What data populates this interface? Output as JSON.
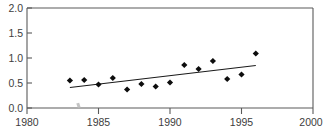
{
  "chart_data": {
    "type": "scatter",
    "title": "",
    "xlabel": "",
    "ylabel": "",
    "xlim": [
      1980,
      2000
    ],
    "ylim": [
      0.0,
      2.0
    ],
    "xticks": [
      1980,
      1985,
      1990,
      1995,
      2000
    ],
    "xtick_labels": [
      "1980",
      "1985",
      "1990",
      "1995",
      "2000"
    ],
    "yticks": [
      0.0,
      0.5,
      1.0,
      1.5,
      2.0
    ],
    "ytick_labels": [
      "0.0",
      "0.5",
      "1.0",
      "1.5",
      "2.0"
    ],
    "grid": false,
    "legend": null,
    "frame": "box",
    "marker": "filled-diamond",
    "marker_color": "#0d0d0d",
    "series": [
      {
        "name": "observations",
        "type": "scatter",
        "x": [
          1983,
          1984,
          1985,
          1986,
          1987,
          1988,
          1989,
          1990,
          1991,
          1992,
          1993,
          1994,
          1995,
          1996
        ],
        "y": [
          0.55,
          0.56,
          0.47,
          0.6,
          0.37,
          0.48,
          0.43,
          0.51,
          0.86,
          0.78,
          0.94,
          0.58,
          0.67,
          1.09
        ]
      },
      {
        "name": "linear-trend",
        "type": "line",
        "x": [
          1983,
          1996
        ],
        "y": [
          0.41,
          0.85
        ],
        "color": "#1a1a1a"
      }
    ],
    "annotations": [
      {
        "name": "clipped-top-text",
        "text": "",
        "note": "text row cropped at image top edge, illegible"
      },
      {
        "name": "stray-mark",
        "x": 1983.3,
        "y": 0.05,
        "note": "small ink smudge near axis"
      }
    ]
  },
  "axes": {
    "y": {
      "labels": [
        "2.0",
        "1.5",
        "1.0",
        "0.5",
        "0.0"
      ]
    },
    "x": {
      "labels": [
        "1980",
        "1985",
        "1990",
        "1995",
        "2000"
      ]
    }
  }
}
